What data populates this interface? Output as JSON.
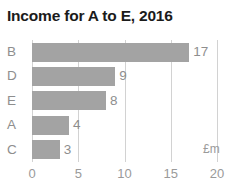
{
  "chart_data": {
    "type": "bar",
    "orientation": "horizontal",
    "title": "Income for A to E, 2016",
    "xlabel": "£m",
    "ylabel": "",
    "categories": [
      "B",
      "D",
      "E",
      "A",
      "C"
    ],
    "values": [
      17,
      9,
      8,
      4,
      3
    ],
    "value_labels": [
      "17",
      "9",
      "8",
      "4",
      "3"
    ],
    "xlim": [
      0,
      20
    ],
    "xticks": [
      0,
      5,
      10,
      15,
      20
    ],
    "xtick_labels": [
      "0",
      "5",
      "10",
      "15",
      "20"
    ],
    "grid": true,
    "grid_axis": "x",
    "legend": false,
    "bar_color": "#a3a3a3",
    "grid_color": "#d2d2d2",
    "text_color": "#8e8e8e",
    "title_color": "#1b1b1b",
    "background": "#ffffff"
  }
}
